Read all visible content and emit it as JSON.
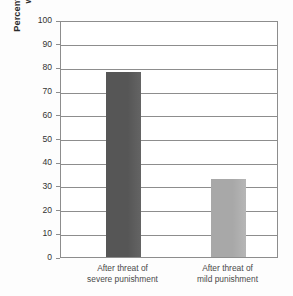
{
  "chart_data": {
    "type": "bar",
    "title": "",
    "subtitle": "",
    "xlabel": "",
    "ylabel": "Percentage of children who played with the forbidden toy",
    "ylabel_lines": [
      "Percentage of children who played",
      "with the forbidden toy"
    ],
    "categories": [
      "After threat of severe punishment",
      "After threat of mild punishment"
    ],
    "category_lines": [
      [
        "After threat of",
        "severe punishment"
      ],
      [
        "After threat of",
        "mild punishment"
      ]
    ],
    "values": [
      78,
      33
    ],
    "ylim": [
      0,
      100
    ],
    "ytick_step": 10,
    "yticks": [
      0,
      10,
      20,
      30,
      40,
      50,
      60,
      70,
      80,
      90,
      100
    ],
    "ytick_labels": [
      "0",
      "10",
      "20",
      "30",
      "40",
      "50",
      "60",
      "70",
      "80",
      "90",
      "100"
    ],
    "grid": true,
    "grid_axis": "y",
    "legend": false,
    "legend_position": "none",
    "bar_colors": [
      "#565656",
      "#a8a8a8"
    ],
    "series": [
      {
        "name": "Percentage of children who played with the forbidden toy",
        "values": [
          78,
          33
        ]
      }
    ]
  },
  "style": {
    "background": "#fdfdfd",
    "plot_background": "#ffffff",
    "axis_color": "#8d8d8d",
    "grid_color": "#8d8d8d",
    "tick_text_color": "#333333",
    "axis_title_color": "#2b2b2b",
    "category_label_color": "#4a4a4a"
  }
}
